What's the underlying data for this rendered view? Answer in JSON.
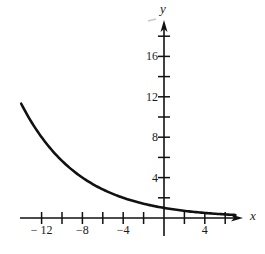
{
  "chart_data": {
    "type": "line",
    "title": "",
    "xlabel": "x",
    "ylabel": "y",
    "function": "y = 2^(-x/4)",
    "xlim": [
      -14.1,
      7.6
    ],
    "ylim": [
      -1.8,
      19.5
    ],
    "grid": false,
    "legend": null,
    "x_ticks": [
      -12,
      -10,
      -8,
      -6,
      -4,
      -2,
      2,
      4,
      6
    ],
    "x_tick_labels": [
      {
        "value": -12,
        "label": "− 12"
      },
      {
        "value": -8,
        "label": "−8"
      },
      {
        "value": -4,
        "label": "−4"
      },
      {
        "value": 4,
        "label": "4"
      }
    ],
    "y_ticks": [
      2,
      4,
      6,
      8,
      10,
      12,
      14,
      16,
      18
    ],
    "y_tick_labels": [
      {
        "value": 4,
        "label": "4"
      },
      {
        "value": 8,
        "label": "8"
      },
      {
        "value": 12,
        "label": "12"
      },
      {
        "value": 16,
        "label": "16"
      }
    ],
    "series": [
      {
        "name": "exponential decay curve",
        "x": [
          -14,
          -12,
          -10,
          -8,
          -6,
          -4,
          -2,
          0,
          2,
          4,
          6,
          7
        ],
        "y": [
          11.31,
          8.0,
          5.66,
          4.0,
          2.83,
          2.0,
          1.41,
          1.0,
          0.71,
          0.5,
          0.35,
          0.3
        ]
      }
    ]
  },
  "layout": {
    "origin_px": [
      164,
      218
    ],
    "px_per_unit_x": 10.2,
    "px_per_unit_y": 10.1,
    "x_axis_px": [
      20,
      243
    ],
    "y_axis_px": [
      236,
      20
    ],
    "curve_color": "#111111",
    "axis_color": "#111111"
  }
}
